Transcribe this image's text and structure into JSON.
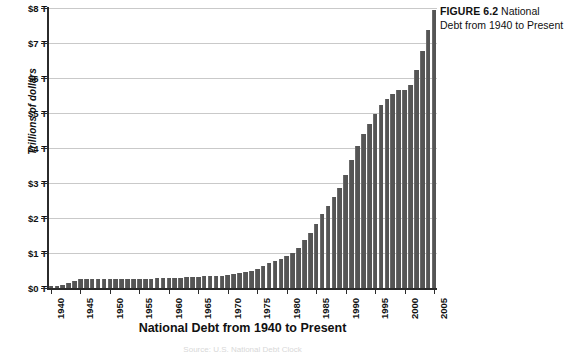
{
  "figure": {
    "number_label": "FIGURE 6.2",
    "caption": "National Debt from 1940 to Present"
  },
  "source_note": "Source: U.S. National Debt Clock",
  "chart_data": {
    "type": "bar",
    "title": "National Debt from 1940 to Present",
    "xlabel": "National Debt from 1940 to Present",
    "ylabel": "Trillions of dollars",
    "ylim": [
      0,
      8
    ],
    "ytick_labels": [
      "$0 T",
      "$1 T",
      "$2 T",
      "$3 T",
      "$4 T",
      "$5 T",
      "$6 T",
      "$7 T",
      "$8 T"
    ],
    "ytick_values": [
      0,
      1,
      2,
      3,
      4,
      5,
      6,
      7,
      8
    ],
    "xtick_labels": [
      "1940",
      "1945",
      "1950",
      "1955",
      "1960",
      "1965",
      "1970",
      "1975",
      "1980",
      "1985",
      "1990",
      "1995",
      "2000",
      "2005"
    ],
    "xtick_values": [
      1940,
      1945,
      1950,
      1955,
      1960,
      1965,
      1970,
      1975,
      1980,
      1985,
      1990,
      1995,
      2000,
      2005
    ],
    "grid": true,
    "legend": false,
    "bar_color": "#555555",
    "axis_color": "#2b2b2b",
    "grid_color": "#c9c9c9",
    "categories": [
      1940,
      1941,
      1942,
      1943,
      1944,
      1945,
      1946,
      1947,
      1948,
      1949,
      1950,
      1951,
      1952,
      1953,
      1954,
      1955,
      1956,
      1957,
      1958,
      1959,
      1960,
      1961,
      1962,
      1963,
      1964,
      1965,
      1966,
      1967,
      1968,
      1969,
      1970,
      1971,
      1972,
      1973,
      1974,
      1975,
      1976,
      1977,
      1978,
      1979,
      1980,
      1981,
      1982,
      1983,
      1984,
      1985,
      1986,
      1987,
      1988,
      1989,
      1990,
      1991,
      1992,
      1993,
      1994,
      1995,
      1996,
      1997,
      1998,
      1999,
      2000,
      2001,
      2002,
      2003,
      2004,
      2005
    ],
    "values": [
      0.05,
      0.06,
      0.08,
      0.14,
      0.2,
      0.26,
      0.27,
      0.26,
      0.25,
      0.25,
      0.26,
      0.26,
      0.26,
      0.27,
      0.27,
      0.27,
      0.27,
      0.27,
      0.28,
      0.28,
      0.29,
      0.29,
      0.3,
      0.31,
      0.32,
      0.32,
      0.33,
      0.34,
      0.35,
      0.35,
      0.37,
      0.4,
      0.43,
      0.46,
      0.48,
      0.54,
      0.63,
      0.71,
      0.78,
      0.83,
      0.91,
      1.0,
      1.14,
      1.37,
      1.56,
      1.82,
      2.12,
      2.35,
      2.6,
      2.86,
      3.23,
      3.67,
      4.06,
      4.41,
      4.69,
      4.97,
      5.22,
      5.41,
      5.53,
      5.66,
      5.67,
      5.81,
      6.23,
      6.78,
      7.38,
      7.93
    ]
  }
}
